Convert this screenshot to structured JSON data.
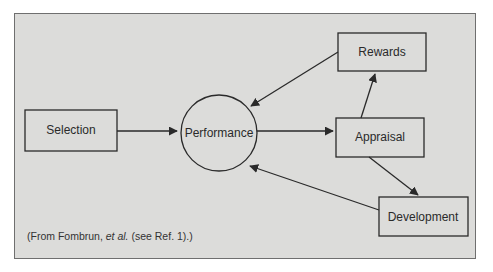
{
  "diagram": {
    "nodes": {
      "selection": {
        "label": "Selection",
        "shape": "rect"
      },
      "performance": {
        "label": "Performance",
        "shape": "circle"
      },
      "rewards": {
        "label": "Rewards",
        "shape": "rect"
      },
      "appraisal": {
        "label": "Appraisal",
        "shape": "rect"
      },
      "development": {
        "label": "Development",
        "shape": "rect"
      }
    },
    "edges": [
      {
        "from": "Selection",
        "to": "Performance"
      },
      {
        "from": "Performance",
        "to": "Appraisal"
      },
      {
        "from": "Appraisal",
        "to": "Rewards"
      },
      {
        "from": "Appraisal",
        "to": "Development"
      },
      {
        "from": "Rewards",
        "to": "Performance"
      },
      {
        "from": "Development",
        "to": "Performance"
      }
    ],
    "caption": {
      "prefix": "(From Fombrun, ",
      "italic": "et al.",
      "suffix": " (see Ref. 1).)"
    },
    "colors": {
      "background": "#dcdcda",
      "stroke": "#2a2a2a"
    }
  }
}
